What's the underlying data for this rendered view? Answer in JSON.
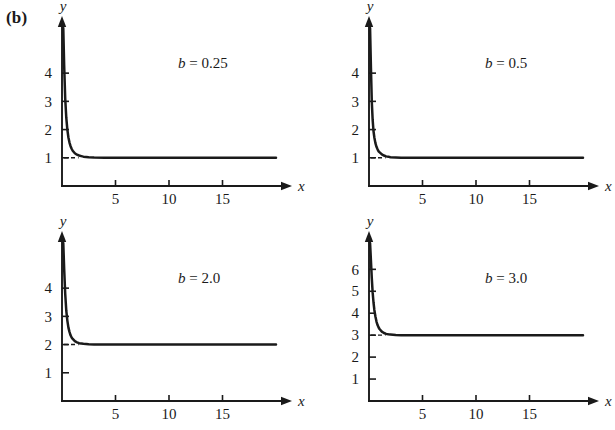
{
  "figure": {
    "part_label": "(b)"
  },
  "chart_data": [
    {
      "type": "line",
      "title": "b = 0.25",
      "annotation": "b = 0.25",
      "param_symbol": "b",
      "param_value": "0.25",
      "xlabel": "x",
      "ylabel": "y",
      "xlim": [
        0,
        20
      ],
      "ylim": [
        0,
        5.6
      ],
      "xticks": [
        5,
        10,
        15
      ],
      "xticklabels": [
        "5",
        "10",
        "15"
      ],
      "yticks": [
        1,
        2,
        3,
        4
      ],
      "yticklabels": [
        "1",
        "2",
        "3",
        "4"
      ],
      "grid": false,
      "asymptote": 1,
      "x": [
        0.12,
        0.2,
        0.3,
        0.4,
        0.5,
        0.6,
        0.7,
        0.8,
        0.9,
        1.0,
        1.2,
        1.4,
        1.6,
        1.8,
        2.0,
        2.5,
        3.0,
        4.0,
        5.0,
        7.0,
        10.0,
        14.0,
        20.0
      ],
      "y": [
        5.6,
        4.3,
        3.1,
        2.42,
        2.0,
        1.72,
        1.54,
        1.41,
        1.32,
        1.25,
        1.16,
        1.11,
        1.08,
        1.06,
        1.04,
        1.02,
        1.01,
        1.0,
        1.0,
        1.0,
        1.0,
        1.0,
        1.0
      ]
    },
    {
      "type": "line",
      "title": "b = 0.5",
      "annotation": "b = 0.5",
      "param_symbol": "b",
      "param_value": "0.5",
      "xlabel": "x",
      "ylabel": "y",
      "xlim": [
        0,
        20
      ],
      "ylim": [
        0,
        5.6
      ],
      "xticks": [
        5,
        10,
        15
      ],
      "xticklabels": [
        "5",
        "10",
        "15"
      ],
      "yticks": [
        1,
        2,
        3,
        4
      ],
      "yticklabels": [
        "1",
        "2",
        "3",
        "4"
      ],
      "grid": false,
      "asymptote": 1,
      "x": [
        0.1,
        0.18,
        0.26,
        0.34,
        0.42,
        0.5,
        0.6,
        0.7,
        0.8,
        0.9,
        1.0,
        1.2,
        1.4,
        1.6,
        1.8,
        2.0,
        2.5,
        3.0,
        4.0,
        6.0,
        10.0,
        14.0,
        20.0
      ],
      "y": [
        5.6,
        4.2,
        3.0,
        2.35,
        1.95,
        1.72,
        1.52,
        1.39,
        1.3,
        1.23,
        1.19,
        1.12,
        1.08,
        1.05,
        1.04,
        1.02,
        1.01,
        1.0,
        1.0,
        1.0,
        1.0,
        1.0,
        1.0
      ]
    },
    {
      "type": "line",
      "title": "b = 2.0",
      "annotation": "b = 2.0",
      "param_symbol": "b",
      "param_value": "2.0",
      "xlabel": "x",
      "ylabel": "y",
      "xlim": [
        0,
        20
      ],
      "ylim": [
        0,
        5.6
      ],
      "xticks": [
        5,
        10,
        15
      ],
      "xticklabels": [
        "5",
        "10",
        "15"
      ],
      "yticks": [
        1,
        2,
        3,
        4
      ],
      "yticklabels": [
        "1",
        "2",
        "3",
        "4"
      ],
      "grid": false,
      "asymptote": 2,
      "x": [
        0.12,
        0.2,
        0.3,
        0.4,
        0.5,
        0.6,
        0.7,
        0.8,
        0.9,
        1.0,
        1.2,
        1.4,
        1.6,
        1.8,
        2.0,
        2.5,
        3.0,
        4.0,
        6.0,
        10.0,
        14.0,
        20.0
      ],
      "y": [
        5.6,
        4.7,
        3.8,
        3.2,
        2.85,
        2.6,
        2.45,
        2.33,
        2.25,
        2.2,
        2.12,
        2.08,
        2.05,
        2.04,
        2.03,
        2.01,
        2.0,
        2.0,
        2.0,
        2.0,
        2.0,
        2.0
      ]
    },
    {
      "type": "line",
      "title": "b = 3.0",
      "annotation": "b = 3.0",
      "param_symbol": "b",
      "param_value": "3.0",
      "xlabel": "x",
      "ylabel": "y",
      "xlim": [
        0,
        20
      ],
      "ylim": [
        0,
        7.2
      ],
      "xticks": [
        5,
        10,
        15
      ],
      "xticklabels": [
        "5",
        "10",
        "15"
      ],
      "yticks": [
        1,
        2,
        3,
        4,
        5,
        6
      ],
      "yticklabels": [
        "1",
        "2",
        "3",
        "4",
        "5",
        "6"
      ],
      "grid": false,
      "asymptote": 3,
      "x": [
        0.1,
        0.18,
        0.26,
        0.34,
        0.42,
        0.5,
        0.6,
        0.7,
        0.8,
        0.9,
        1.0,
        1.2,
        1.4,
        1.6,
        1.8,
        2.0,
        2.5,
        3.0,
        4.0,
        6.0,
        10.0,
        14.0,
        20.0
      ],
      "y": [
        7.2,
        6.4,
        5.6,
        4.95,
        4.5,
        4.15,
        3.85,
        3.62,
        3.46,
        3.35,
        3.27,
        3.16,
        3.1,
        3.06,
        3.04,
        3.03,
        3.01,
        3.0,
        3.0,
        3.0,
        3.0,
        3.0,
        3.0
      ]
    }
  ]
}
